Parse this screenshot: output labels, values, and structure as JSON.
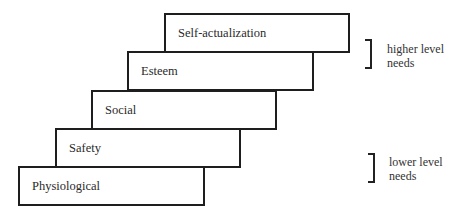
{
  "diagram": {
    "type": "staircase",
    "title": "",
    "steps": [
      {
        "label": "Physiological"
      },
      {
        "label": "Safety"
      },
      {
        "label": "Social"
      },
      {
        "label": "Esteem"
      },
      {
        "label": "Self-actualization"
      }
    ],
    "annotations": {
      "higher": {
        "line1": "higher level",
        "line2": "needs"
      },
      "lower": {
        "line1": "lower level",
        "line2": "needs"
      }
    }
  }
}
